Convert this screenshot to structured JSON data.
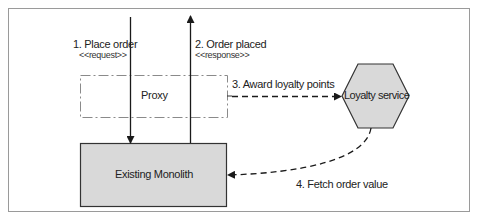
{
  "diagram": {
    "nodes": {
      "proxy": {
        "label": "Proxy",
        "style": "dash-dot outline"
      },
      "loyalty_service": {
        "label": "Loyalty service",
        "shape": "hexagon",
        "fill": "#d9d9d9"
      },
      "monolith": {
        "label": "Existing Monolith",
        "shape": "rectangle",
        "fill": "#d9d9d9"
      }
    },
    "edges": [
      {
        "id": "e1",
        "label": "1. Place order",
        "stereotype": "<<request>>",
        "from": "outside",
        "to": "monolith",
        "style": "solid"
      },
      {
        "id": "e2",
        "label": "2. Order placed",
        "stereotype": "<<response>>",
        "from": "monolith",
        "to": "outside",
        "style": "solid"
      },
      {
        "id": "e3",
        "label": "3. Award loyalty points",
        "from": "proxy",
        "to": "loyalty_service",
        "style": "dashed"
      },
      {
        "id": "e4",
        "label": "4. Fetch order value",
        "from": "loyalty_service",
        "to": "monolith",
        "style": "dashed"
      }
    ],
    "colors": {
      "border": "#9a9a9a",
      "fill": "#d9d9d9",
      "line": "#1a1a1a"
    }
  }
}
